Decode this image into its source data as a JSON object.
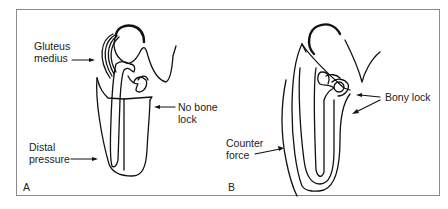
{
  "figure": {
    "panels": [
      {
        "id": "A",
        "letter": "A",
        "labels": {
          "gluteus_line1": "Gluteus",
          "gluteus_line2": "medius",
          "no_bone_line1": "No bone",
          "no_bone_line2": "lock",
          "distal_line1": "Distal",
          "distal_line2": "pressure"
        }
      },
      {
        "id": "B",
        "letter": "B",
        "labels": {
          "bony_lock": "Bony lock",
          "counter_line1": "Counter",
          "counter_line2": "force"
        }
      }
    ],
    "colors": {
      "line": "#111111",
      "frame": "#8a8a8a",
      "text": "#222222",
      "background": "#ffffff"
    }
  }
}
